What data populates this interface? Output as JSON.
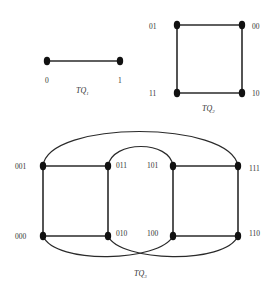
{
  "diagrams": {
    "tq1": {
      "caption": "TQ",
      "caption_sub": "1",
      "nodes": [
        {
          "label": "0"
        },
        {
          "label": "1"
        }
      ]
    },
    "tq2": {
      "caption": "TQ",
      "caption_sub": "2",
      "nodes": [
        {
          "label": "01"
        },
        {
          "label": "00"
        },
        {
          "label": "11"
        },
        {
          "label": "10"
        }
      ]
    },
    "tq3": {
      "caption": "TQ",
      "caption_sub": "3",
      "nodes": [
        {
          "label": "001"
        },
        {
          "label": "011"
        },
        {
          "label": "101"
        },
        {
          "label": "111"
        },
        {
          "label": "000"
        },
        {
          "label": "010"
        },
        {
          "label": "100"
        },
        {
          "label": "110"
        }
      ]
    }
  },
  "colors": {
    "edge": "#2a2a2a",
    "node": "#111111",
    "text": "#333333",
    "background": "#ffffff"
  }
}
